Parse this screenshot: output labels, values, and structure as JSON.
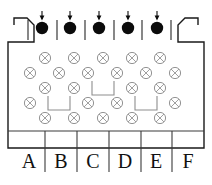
{
  "figure": {
    "canvas": {
      "width": 212,
      "height": 185
    },
    "colors": {
      "outline": "#1a1a1a",
      "input_dot": "#0b0b0b",
      "site_symbol": "#8e8e8e",
      "separator": "#3a3a3a",
      "background": "#ffffff"
    }
  },
  "container": {
    "name": "funnel-body",
    "outline_points": "14,25 14,18 27,18 34,25 34,42 8,42 8,148 204,148 204,42 178,42 178,25 185,18 198,18 198,25",
    "chamfer_note": "top corners chamfered inward"
  },
  "inputs": {
    "label": "input-channels",
    "count": 5,
    "dot_radius": 6.2,
    "y": 28,
    "items": [
      {
        "id": "input-1",
        "x": 42,
        "arrow": "down"
      },
      {
        "id": "input-2",
        "x": 70,
        "arrow": "down"
      },
      {
        "id": "input-3",
        "x": 99,
        "arrow": "down"
      },
      {
        "id": "input-4",
        "x": 128,
        "arrow": "down"
      },
      {
        "id": "input-5",
        "x": 157,
        "arrow": "down"
      }
    ],
    "tick_marks": [
      {
        "id": "tick-1",
        "x": 28
      },
      {
        "id": "tick-2",
        "x": 57
      },
      {
        "id": "tick-3",
        "x": 85
      },
      {
        "id": "tick-4",
        "x": 114
      },
      {
        "id": "tick-5",
        "x": 142
      },
      {
        "id": "tick-6",
        "x": 171
      }
    ],
    "tick_top": 20,
    "tick_bottom": 40,
    "arrow_top": 11,
    "arrow_bottom": 19
  },
  "lattice": {
    "label": "site-lattice",
    "symbol": "circle-with-x",
    "site_radius": 5.6,
    "rows": [
      {
        "id": "lattice-row-1",
        "y": 58,
        "cells": [
          {
            "type": "site",
            "x": 45
          },
          {
            "type": "site",
            "x": 74
          },
          {
            "type": "site",
            "x": 103
          },
          {
            "type": "site",
            "x": 132
          },
          {
            "type": "site",
            "x": 160
          }
        ]
      },
      {
        "id": "lattice-row-2",
        "y": 73,
        "cells": [
          {
            "type": "site",
            "x": 30
          },
          {
            "type": "site",
            "x": 59
          },
          {
            "type": "site",
            "x": 88
          },
          {
            "type": "site",
            "x": 117
          },
          {
            "type": "site",
            "x": 146
          },
          {
            "type": "site",
            "x": 175
          }
        ]
      },
      {
        "id": "lattice-row-3",
        "y": 88,
        "cells": [
          {
            "type": "site",
            "x": 45
          },
          {
            "type": "site",
            "x": 74
          },
          {
            "type": "bracket",
            "x": 103
          },
          {
            "type": "site",
            "x": 132
          },
          {
            "type": "site",
            "x": 160
          }
        ]
      },
      {
        "id": "lattice-row-4",
        "y": 103,
        "cells": [
          {
            "type": "site",
            "x": 30
          },
          {
            "type": "bracket",
            "x": 59
          },
          {
            "type": "site",
            "x": 88
          },
          {
            "type": "site",
            "x": 117
          },
          {
            "type": "bracket",
            "x": 146
          },
          {
            "type": "site",
            "x": 175
          }
        ]
      },
      {
        "id": "lattice-row-5",
        "y": 118,
        "cells": [
          {
            "type": "site",
            "x": 45
          },
          {
            "type": "site",
            "x": 74
          },
          {
            "type": "site",
            "x": 103
          },
          {
            "type": "site",
            "x": 132
          },
          {
            "type": "site",
            "x": 160
          }
        ]
      }
    ],
    "bracket_shape": {
      "half_width": 11,
      "depth": 7
    }
  },
  "output_row": {
    "label": "output-columns",
    "top_line_y": 131,
    "baseline_y": 172,
    "text_y": 168,
    "columns": [
      {
        "id": "column-a",
        "label": "A",
        "x": 29,
        "divider_x": 45
      },
      {
        "id": "column-b",
        "label": "B",
        "x": 61,
        "divider_x": 77
      },
      {
        "id": "column-c",
        "label": "C",
        "x": 93,
        "divider_x": 109
      },
      {
        "id": "column-d",
        "label": "D",
        "x": 125,
        "divider_x": 141
      },
      {
        "id": "column-e",
        "label": "E",
        "x": 156,
        "divider_x": 172
      },
      {
        "id": "column-f",
        "label": "F",
        "x": 188,
        "divider_x": null
      }
    ]
  }
}
